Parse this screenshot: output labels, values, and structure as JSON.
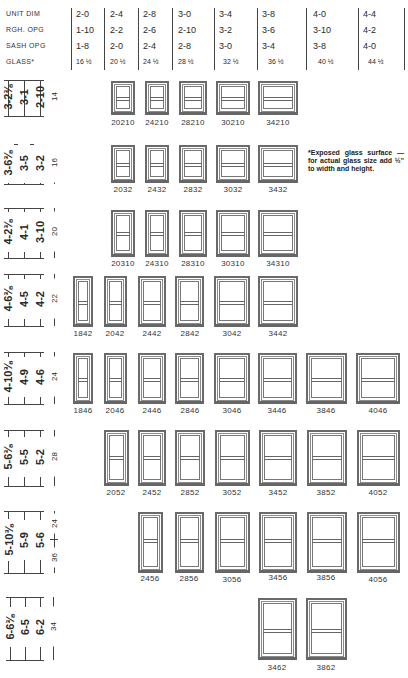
{
  "header": {
    "labels": [
      "UNIT DIM",
      "RGH. OPG",
      "SASH OPG",
      "GLASS*"
    ],
    "unit_dim": [
      "2-0",
      "2-4",
      "2-8",
      "3-0",
      "3-4",
      "3-8",
      "4-0",
      "4-4"
    ],
    "rgh_opg": [
      "1-10",
      "2-2",
      "2-6",
      "2-10",
      "3-2",
      "3-6",
      "3-10",
      "4-2"
    ],
    "sash_opg": [
      "1-8",
      "2-0",
      "2-4",
      "2-8",
      "3-0",
      "3-4",
      "3-8",
      "4-0"
    ],
    "glass": [
      "16 ½",
      "20 ½",
      "24 ½",
      "28 ½",
      "32 ½",
      "36 ½",
      "40 ½",
      "44 ½"
    ]
  },
  "note": "*Exposed glass surface —for actual glass size add ½'' to width and height.",
  "rows": [
    {
      "unit_dim": "3-2⅜",
      "rgh_opg": "3-1",
      "sash_opg": "2-10",
      "glass": "14",
      "windows": [
        {
          "code": "20210"
        },
        {
          "code": "24210"
        },
        {
          "code": "28210"
        },
        {
          "code": "30210"
        },
        {
          "code": "34210"
        }
      ]
    },
    {
      "unit_dim": "3-6⅜",
      "rgh_opg": "3-5",
      "sash_opg": "3-2",
      "glass": "16",
      "windows": [
        {
          "code": "2032"
        },
        {
          "code": "2432"
        },
        {
          "code": "2832"
        },
        {
          "code": "3032"
        },
        {
          "code": "3432"
        }
      ]
    },
    {
      "unit_dim": "4-2⅜",
      "rgh_opg": "4-1",
      "sash_opg": "3-10",
      "glass": "20",
      "windows": [
        {
          "code": "20310"
        },
        {
          "code": "24310"
        },
        {
          "code": "28310"
        },
        {
          "code": "30310"
        },
        {
          "code": "34310"
        }
      ]
    },
    {
      "unit_dim": "4-6⅜",
      "rgh_opg": "4-5",
      "sash_opg": "4-2",
      "glass": "22",
      "windows": [
        {
          "code": "1842"
        },
        {
          "code": "2042"
        },
        {
          "code": "2442"
        },
        {
          "code": "2842"
        },
        {
          "code": "3042"
        },
        {
          "code": "3442"
        }
      ]
    },
    {
      "unit_dim": "4-10⅜",
      "rgh_opg": "4-9",
      "sash_opg": "4-6",
      "glass": "24",
      "windows": [
        {
          "code": "1846"
        },
        {
          "code": "2046"
        },
        {
          "code": "2446"
        },
        {
          "code": "2846"
        },
        {
          "code": "3046"
        },
        {
          "code": "3446"
        },
        {
          "code": "3846"
        },
        {
          "code": "4046"
        }
      ]
    },
    {
      "unit_dim": "5-6⅜",
      "rgh_opg": "5-5",
      "sash_opg": "5-2",
      "glass": "28",
      "windows": [
        {
          "code": "2052"
        },
        {
          "code": "2452"
        },
        {
          "code": "2852"
        },
        {
          "code": "3052"
        },
        {
          "code": "3452"
        },
        {
          "code": "3852"
        },
        {
          "code": "4052"
        }
      ]
    },
    {
      "unit_dim": "5-10⅜",
      "rgh_opg": "5-9",
      "sash_opg": "5-6",
      "glass": "36",
      "glass_top": "24",
      "windows": [
        {
          "code": "2456"
        },
        {
          "code": "2856"
        },
        {
          "code": "3056"
        },
        {
          "code": "3456"
        },
        {
          "code": "3856"
        },
        {
          "code": "4056"
        }
      ]
    },
    {
      "unit_dim": "6-6⅜",
      "rgh_opg": "6-5",
      "sash_opg": "6-2",
      "glass": "34",
      "windows": [
        {
          "code": "3462"
        },
        {
          "code": "3862"
        }
      ]
    }
  ]
}
